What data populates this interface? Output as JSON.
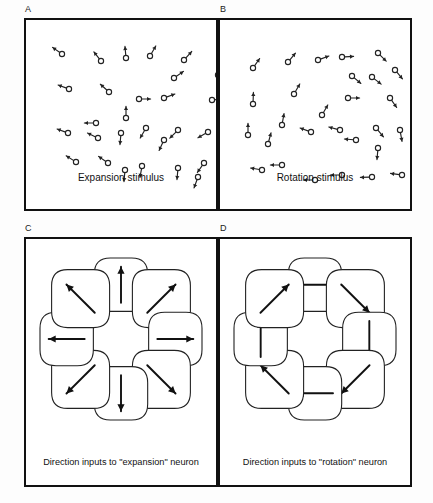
{
  "figure": {
    "background_color": "#fdfdfd",
    "ink_color": "#111111",
    "panel_count": 4
  },
  "panels": [
    {
      "id": "A",
      "label": "A",
      "caption": "Expansion stimulus",
      "type": "dot-motion-stimulus",
      "pattern": "expansion",
      "x": 24,
      "y": 18,
      "width": 194,
      "height": 193
    },
    {
      "id": "B",
      "label": "B",
      "caption": "Rotation stimulus",
      "type": "dot-motion-stimulus",
      "pattern": "rotation",
      "x": 218,
      "y": 18,
      "width": 194,
      "height": 193
    },
    {
      "id": "C",
      "label": "C",
      "caption": "Direction inputs to \"expansion\" neuron",
      "type": "receptive-field-ring",
      "pattern": "radial-outward",
      "x": 24,
      "y": 237,
      "width": 194,
      "height": 250
    },
    {
      "id": "D",
      "label": "D",
      "caption": "Direction inputs to \"rotation\" neuron",
      "type": "receptive-field-ring",
      "pattern": "tangential-clockwise",
      "x": 218,
      "y": 237,
      "width": 194,
      "height": 250
    }
  ],
  "chart_data": {
    "type": "scatter",
    "stimulus_dot_radius": 2.6,
    "stimulus_vector_length": 9,
    "expansion_dots": [
      {
        "x": 36,
        "y": 34,
        "angle": 215
      },
      {
        "x": 75,
        "y": 41,
        "angle": 232
      },
      {
        "x": 100,
        "y": 38,
        "angle": 265
      },
      {
        "x": 124,
        "y": 36,
        "angle": 300
      },
      {
        "x": 158,
        "y": 40,
        "angle": 312
      },
      {
        "x": 192,
        "y": 55,
        "angle": 330
      },
      {
        "x": 148,
        "y": 58,
        "angle": 325
      },
      {
        "x": 43,
        "y": 69,
        "angle": 200
      },
      {
        "x": 83,
        "y": 72,
        "angle": 222
      },
      {
        "x": 138,
        "y": 78,
        "angle": 340
      },
      {
        "x": 186,
        "y": 80,
        "angle": 355
      },
      {
        "x": 113,
        "y": 79,
        "angle": 0
      },
      {
        "x": 100,
        "y": 98,
        "angle": 270
      },
      {
        "x": 70,
        "y": 103,
        "angle": 180
      },
      {
        "x": 42,
        "y": 113,
        "angle": 200
      },
      {
        "x": 95,
        "y": 113,
        "angle": 95
      },
      {
        "x": 120,
        "y": 108,
        "angle": 120
      },
      {
        "x": 152,
        "y": 110,
        "angle": 135
      },
      {
        "x": 182,
        "y": 112,
        "angle": 150
      },
      {
        "x": 72,
        "y": 118,
        "angle": 205
      },
      {
        "x": 138,
        "y": 120,
        "angle": 115
      },
      {
        "x": 50,
        "y": 142,
        "angle": 212
      },
      {
        "x": 82,
        "y": 143,
        "angle": 215
      },
      {
        "x": 99,
        "y": 150,
        "angle": 95
      },
      {
        "x": 116,
        "y": 146,
        "angle": 100
      },
      {
        "x": 152,
        "y": 148,
        "angle": 95
      },
      {
        "x": 178,
        "y": 143,
        "angle": 125
      },
      {
        "x": 172,
        "y": 157,
        "angle": 110
      }
    ],
    "rotation_dots": [
      {
        "x": 33,
        "y": 48,
        "angle": 305
      },
      {
        "x": 68,
        "y": 42,
        "angle": 310
      },
      {
        "x": 98,
        "y": 40,
        "angle": 340
      },
      {
        "x": 122,
        "y": 37,
        "angle": 357
      },
      {
        "x": 158,
        "y": 33,
        "angle": 45
      },
      {
        "x": 132,
        "y": 56,
        "angle": 40
      },
      {
        "x": 152,
        "y": 57,
        "angle": 38
      },
      {
        "x": 175,
        "y": 50,
        "angle": 50
      },
      {
        "x": 33,
        "y": 84,
        "angle": 272
      },
      {
        "x": 74,
        "y": 74,
        "angle": 300
      },
      {
        "x": 128,
        "y": 78,
        "angle": 0
      },
      {
        "x": 170,
        "y": 78,
        "angle": 55
      },
      {
        "x": 62,
        "y": 105,
        "angle": 280
      },
      {
        "x": 102,
        "y": 95,
        "angle": 300
      },
      {
        "x": 28,
        "y": 115,
        "angle": 270
      },
      {
        "x": 48,
        "y": 124,
        "angle": 285
      },
      {
        "x": 91,
        "y": 112,
        "angle": 200
      },
      {
        "x": 120,
        "y": 110,
        "angle": 195
      },
      {
        "x": 156,
        "y": 108,
        "angle": 50
      },
      {
        "x": 180,
        "y": 110,
        "angle": 80
      },
      {
        "x": 136,
        "y": 120,
        "angle": 185
      },
      {
        "x": 158,
        "y": 128,
        "angle": 95
      },
      {
        "x": 42,
        "y": 150,
        "angle": 190
      },
      {
        "x": 62,
        "y": 145,
        "angle": 180
      },
      {
        "x": 95,
        "y": 160,
        "angle": 180
      },
      {
        "x": 122,
        "y": 155,
        "angle": 180
      },
      {
        "x": 152,
        "y": 157,
        "angle": 178
      },
      {
        "x": 182,
        "y": 155,
        "angle": 188
      }
    ],
    "ring_lobes_expansion": [
      {
        "position": "top",
        "arrow_angle_deg": 270,
        "direction": "up"
      },
      {
        "position": "top-right",
        "arrow_angle_deg": 315,
        "direction": "up-right"
      },
      {
        "position": "right",
        "arrow_angle_deg": 0,
        "direction": "right"
      },
      {
        "position": "bottom-right",
        "arrow_angle_deg": 45,
        "direction": "down-right"
      },
      {
        "position": "bottom",
        "arrow_angle_deg": 90,
        "direction": "down"
      },
      {
        "position": "bottom-left",
        "arrow_angle_deg": 135,
        "direction": "down-left"
      },
      {
        "position": "left",
        "arrow_angle_deg": 180,
        "direction": "left"
      },
      {
        "position": "top-left",
        "arrow_angle_deg": 225,
        "direction": "up-left"
      }
    ],
    "ring_lobes_rotation": [
      {
        "position": "top",
        "arrow_angle_deg": 0,
        "direction": "right"
      },
      {
        "position": "top-right",
        "arrow_angle_deg": 45,
        "direction": "down-right"
      },
      {
        "position": "right",
        "arrow_angle_deg": 90,
        "direction": "down"
      },
      {
        "position": "bottom-right",
        "arrow_angle_deg": 135,
        "direction": "down-left"
      },
      {
        "position": "bottom",
        "arrow_angle_deg": 180,
        "direction": "left"
      },
      {
        "position": "bottom-left",
        "arrow_angle_deg": 225,
        "direction": "up-left"
      },
      {
        "position": "left",
        "arrow_angle_deg": 270,
        "direction": "up"
      },
      {
        "position": "top-left",
        "arrow_angle_deg": 315,
        "direction": "up-right"
      }
    ]
  }
}
